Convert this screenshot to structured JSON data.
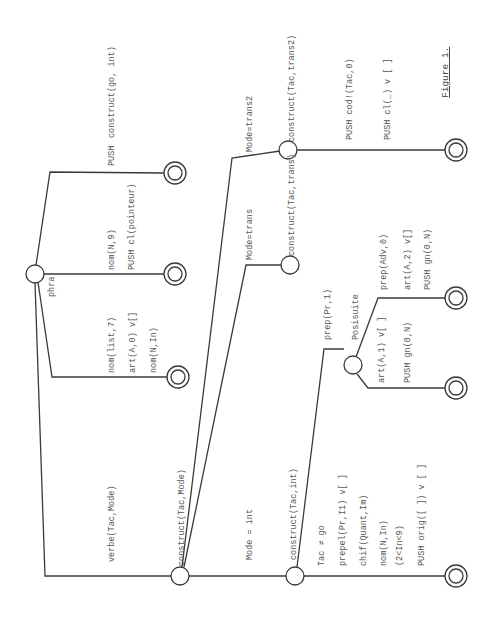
{
  "figure": {
    "caption": "Figure 1.",
    "orientation": "rotated 90deg counter-clockwise",
    "colors": {
      "ink": "#3a3a3a",
      "text": "#555555",
      "background": "#ffffff"
    }
  },
  "nodes": {
    "phra": {
      "label": "phra"
    },
    "construct_mode": {
      "label": "construct(Tac,Mode)"
    },
    "construct_int": {
      "label": "construct(Tac,int)"
    },
    "construct_trans": {
      "label": "construct(Tac,trans)"
    },
    "construct_trans2": {
      "label": "construct(Tac,trans2)"
    },
    "posisuite": {
      "label": "Posisuite"
    }
  },
  "arcs": {
    "verbe": {
      "lines": [
        "verbe(Tac,Mode)"
      ]
    },
    "phra_1": {
      "lines": [
        "PUSH",
        "construct(go, int)"
      ]
    },
    "phra_2": {
      "lines": [
        "nom(N,9)",
        "PUSH cl(pointeur)"
      ]
    },
    "phra_3": {
      "lines": [
        "nom(list,7)",
        "art(A,0)    v[]",
        "nom(N,In)"
      ]
    },
    "mode_int": {
      "lines": [
        "Mode = int"
      ]
    },
    "mode_trans": {
      "lines": [
        "Mode=trans"
      ]
    },
    "mode_trans2": {
      "lines": [
        "Mode=trans2"
      ]
    },
    "trans2_final": {
      "lines": [
        "PUSH   cod!(Tac,0)",
        "PUSH   cl(_)      v [ ]"
      ]
    },
    "int_prep": {
      "lines": [
        "prep(Pr,1)"
      ]
    },
    "int_final": {
      "lines": [
        "Tac ≠ go",
        "prepel(Pr,I1) v[ ]",
        "chif(Quant,Im)",
        "nom(N,In)",
        "  (2<In<9)",
        "PUSH orig([ ]) v [ ]"
      ]
    },
    "posi_1": {
      "lines": [
        "prep(Adv,0)",
        "art(A,2) v[]",
        "PUSH gn(0,N)"
      ]
    },
    "posi_2": {
      "lines": [
        "art(A,1) v[ ]",
        "PUSH gn(0,N)"
      ]
    }
  }
}
